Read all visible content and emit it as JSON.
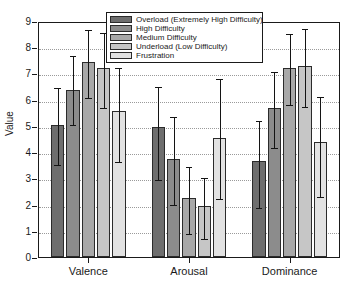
{
  "chart_data": {
    "type": "bar",
    "title": "",
    "xlabel": "",
    "ylabel": "Value",
    "ylim": [
      0,
      9
    ],
    "yticks": [
      0,
      1,
      2,
      3,
      4,
      5,
      6,
      7,
      8,
      9
    ],
    "ytick_labels": [
      "0",
      "1",
      "2",
      "3",
      "4",
      "5",
      "6",
      "7",
      "8",
      "9"
    ],
    "grid": true,
    "grid_style": "dotted-horizontal",
    "legend_position": "top-center",
    "categories": [
      "Valence",
      "Arousal",
      "Dominance"
    ],
    "series": [
      {
        "name": "Overload (Extremely High Difficulty)",
        "color": "#6e6e6e",
        "values": [
          5.05,
          4.97,
          3.65
        ],
        "err_low": [
          3.58,
          3.0,
          1.93
        ],
        "err_high": [
          6.52,
          6.55,
          5.25
        ]
      },
      {
        "name": "High Difficulty",
        "color": "#8c8c8c",
        "values": [
          6.38,
          3.73,
          5.7
        ],
        "err_low": [
          5.12,
          2.05,
          4.25
        ],
        "err_high": [
          7.75,
          5.4,
          7.12
        ]
      },
      {
        "name": "Medium Difficulty",
        "color": "#a8a8a8",
        "values": [
          7.45,
          2.25,
          7.22
        ],
        "err_low": [
          6.15,
          0.95,
          5.88
        ],
        "err_high": [
          8.72,
          3.52,
          8.58
        ]
      },
      {
        "name": "Underload (Low Difficulty)",
        "color": "#c6c6c6",
        "values": [
          7.22,
          1.95,
          7.3
        ],
        "err_low": [
          5.75,
          0.78,
          5.78
        ],
        "err_high": [
          8.62,
          3.07,
          8.78
        ]
      },
      {
        "name": "Frustration",
        "color": "#e2e2e2",
        "values": [
          5.55,
          4.55,
          4.38
        ],
        "err_low": [
          3.7,
          2.28,
          2.38
        ],
        "err_high": [
          7.3,
          6.85,
          6.18
        ]
      }
    ]
  },
  "axes": {
    "y_title": "Value",
    "frame_color": "#1a1a1a"
  }
}
